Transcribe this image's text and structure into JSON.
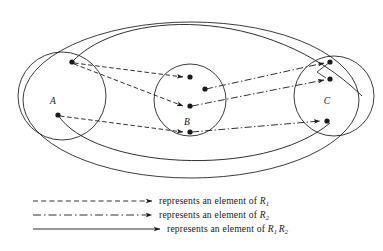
{
  "diagram": {
    "sets": [
      {
        "id": "A",
        "label": "A",
        "cx": 62,
        "cy": 96,
        "r": 44,
        "label_x": 53,
        "label_y": 104,
        "points": [
          {
            "x": 72,
            "y": 62
          },
          {
            "x": 58,
            "y": 115
          }
        ]
      },
      {
        "id": "B",
        "label": "B",
        "cx": 190,
        "cy": 100,
        "r": 36,
        "label_x": 187,
        "label_y": 125,
        "points": [
          {
            "x": 190,
            "y": 77
          },
          {
            "x": 205,
            "y": 89
          },
          {
            "x": 190,
            "y": 106
          },
          {
            "x": 190,
            "y": 132
          }
        ]
      },
      {
        "id": "C",
        "label": "C",
        "cx": 334,
        "cy": 96,
        "r": 40,
        "label_x": 327,
        "label_y": 104,
        "points": [
          {
            "x": 330,
            "y": 62
          },
          {
            "x": 330,
            "y": 79
          },
          {
            "x": 327,
            "y": 121
          }
        ]
      }
    ],
    "outer_ellipse": {
      "cx": 191,
      "cy": 100,
      "rx": 168,
      "ry": 78
    },
    "edges_R1_dashed": 3,
    "edges_R2_dashdot": 3,
    "edges_composition_solid": 2
  },
  "legend": {
    "rows": [
      {
        "style": "dashed",
        "text_prefix": "represents an element of ",
        "symbol": "R",
        "sub1": "1",
        "symbol2": "",
        "sub2": ""
      },
      {
        "style": "dashdot",
        "text_prefix": "represents an element of ",
        "symbol": "R",
        "sub1": "2",
        "symbol2": "",
        "sub2": ""
      },
      {
        "style": "solid",
        "text_prefix": "represents an element of ",
        "symbol": "R",
        "sub1": "1",
        "symbol2": "R",
        "sub2": "2"
      }
    ]
  },
  "colors": {
    "ink": "#1a1a1a",
    "background": "#ffffff"
  }
}
